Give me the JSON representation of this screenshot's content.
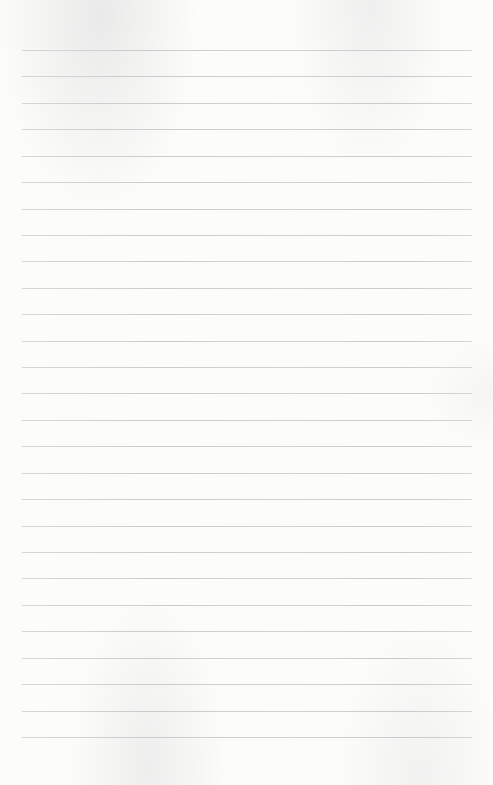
{
  "page": {
    "type": "lined-paper",
    "background_color": "#fcfcfb",
    "rule_color": "#c8c8c8",
    "rules": {
      "count": 27,
      "first_y": 50,
      "spacing": 26.42,
      "left": 22,
      "right": 472
    },
    "text": ""
  }
}
